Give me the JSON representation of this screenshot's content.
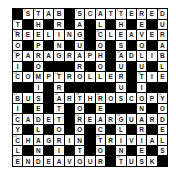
{
  "puzzle": {
    "type": "crossword",
    "rows": 15,
    "cols": 15,
    "grid": [
      "#STAB#SCATTERED",
      "T#H#R#A#L#H#E#U",
      "REELING#CLEAVER",
      "O#P#N#U#O#S#O#A",
      "PARAGRAPH#ADLIB",
      "I#O###R#O#U#U#L",
      "COMPTROLLER#TIE",
      "##I#R#####U#I##",
      "BUS#ARTHROSCOPY",
      "I#E#T#O#E###N#O",
      "CADET#REARGUARD",
      "Y#L#O#O#C#L#R#E",
      "CHAGRIN#TRIVIAL",
      "L#N#I#T#O#N#E#S",
      "ENDEAVOUR#TUSK#"
    ],
    "across_words": [
      "STAB",
      "SCATTERED",
      "REELING",
      "CLEAVER",
      "PARAGRAPH",
      "ADLIB",
      "COMPTROLLER",
      "TIE",
      "BUS",
      "ARTHROSCOPY",
      "CADET",
      "REARGUARD",
      "CHAGRIN",
      "TRIVIAL",
      "ENDEAVOUR",
      "TUSK"
    ],
    "down_words": [
      "TROPIC",
      "THE PROMISED LAND",
      "BRING",
      "TRATTORIA",
      "SAGUARO",
      "TORONTO",
      "ALCOHOL",
      "REACTOR",
      "THESAURUS",
      "GLINT",
      "REVOLUTION",
      "DURABLE",
      "BICYCLE",
      "YODELS"
    ]
  }
}
